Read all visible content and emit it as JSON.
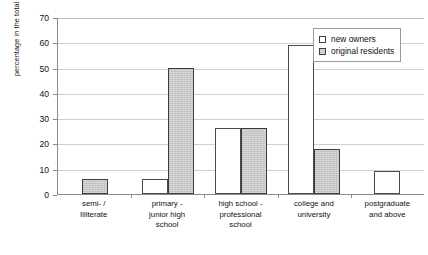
{
  "chart_data": {
    "type": "bar",
    "title": "",
    "xlabel": "",
    "ylabel": "percentage in the total residents",
    "ylim": [
      0,
      70
    ],
    "yticks": [
      0,
      10,
      20,
      30,
      40,
      50,
      60,
      70
    ],
    "grid": true,
    "legend_position": "top-right-inside",
    "categories": [
      "semi- /\nIlliterate",
      "primary -\njunior high\nschool",
      "high school -\nprofessional\nschool",
      "college and\nuniversity",
      "postgraduate\nand above"
    ],
    "category_lines": [
      [
        "semi- /",
        "Illiterate"
      ],
      [
        "primary -",
        "junior high",
        "school"
      ],
      [
        "high school -",
        "professional",
        "school"
      ],
      [
        "college and",
        "university"
      ],
      [
        "postgraduate",
        "and above"
      ]
    ],
    "series": [
      {
        "name": "new owners",
        "color": "#ffffff",
        "values": [
          null,
          6,
          26,
          59,
          9
        ]
      },
      {
        "name": "original residents",
        "color": "#c6c6c6",
        "values": [
          6,
          50,
          26,
          18,
          null
        ]
      }
    ]
  },
  "legend": {
    "items": [
      {
        "label": "new owners",
        "swatch": "white-square-icon"
      },
      {
        "label": "original residents",
        "swatch": "gray-square-icon"
      }
    ]
  },
  "axis": {
    "y_title": "percentage in the total residents",
    "y_tick_labels": [
      "70",
      "60",
      "50",
      "40",
      "30",
      "20",
      "10",
      "0"
    ]
  }
}
